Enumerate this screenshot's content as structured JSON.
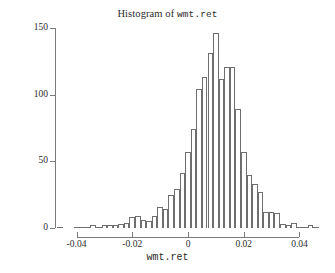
{
  "chart_data": {
    "type": "bar",
    "title": "Histogram of wmt.ret",
    "title_prefix": "Histogram of ",
    "title_variable": "wmt.ret",
    "xlabel": "wmt.ret",
    "ylabel": "Frequency",
    "xlim": [
      -0.047,
      0.047
    ],
    "ylim": [
      0,
      150
    ],
    "grid": false,
    "legend": null,
    "bin_width": 0.002,
    "xticks": [
      -0.04,
      -0.02,
      0,
      0.02,
      0.04
    ],
    "xtick_labels": [
      "-0.04",
      "-0.02",
      "0",
      "0.02",
      "0.04"
    ],
    "yticks": [
      0,
      50,
      100,
      150
    ],
    "ytick_labels": [
      "0",
      "50",
      "100",
      "150"
    ],
    "bin_edges": [
      -0.047,
      -0.045,
      -0.043,
      -0.041,
      -0.039,
      -0.037,
      -0.035,
      -0.033,
      -0.031,
      -0.029,
      -0.027,
      -0.025,
      -0.023,
      -0.021,
      -0.019,
      -0.017,
      -0.015,
      -0.013,
      -0.011,
      -0.009,
      -0.007,
      -0.005,
      -0.003,
      -0.001,
      0.001,
      0.003,
      0.005,
      0.007,
      0.009,
      0.011,
      0.013,
      0.015,
      0.017,
      0.019,
      0.021,
      0.023,
      0.025,
      0.027,
      0.029,
      0.031,
      0.033,
      0.035,
      0.037,
      0.039,
      0.041,
      0.043,
      0.045,
      0.047
    ],
    "bin_centers": [
      -0.046,
      -0.044,
      -0.042,
      -0.04,
      -0.038,
      -0.036,
      -0.034,
      -0.032,
      -0.03,
      -0.028,
      -0.026,
      -0.024,
      -0.022,
      -0.02,
      -0.018,
      -0.016,
      -0.014,
      -0.012,
      -0.01,
      -0.008,
      -0.006,
      -0.004,
      -0.002,
      0.0,
      0.002,
      0.004,
      0.006,
      0.008,
      0.01,
      0.012,
      0.014,
      0.016,
      0.018,
      0.02,
      0.022,
      0.024,
      0.026,
      0.028,
      0.03,
      0.032,
      0.034,
      0.036,
      0.038,
      0.04,
      0.042,
      0.044,
      0.046
    ],
    "categories": [
      "-0.046",
      "-0.044",
      "-0.042",
      "-0.040",
      "-0.038",
      "-0.036",
      "-0.034",
      "-0.032",
      "-0.030",
      "-0.028",
      "-0.026",
      "-0.024",
      "-0.022",
      "-0.020",
      "-0.018",
      "-0.016",
      "-0.014",
      "-0.012",
      "-0.010",
      "-0.008",
      "-0.006",
      "-0.004",
      "-0.002",
      "0.000",
      "0.002",
      "0.004",
      "0.006",
      "0.008",
      "0.010",
      "0.012",
      "0.014",
      "0.016",
      "0.018",
      "0.020",
      "0.022",
      "0.024",
      "0.026",
      "0.028",
      "0.030",
      "0.032",
      "0.034",
      "0.036",
      "0.038",
      "0.040",
      "0.042",
      "0.044",
      "0.046"
    ],
    "values": [
      1,
      0,
      0,
      1,
      1,
      1,
      2,
      1,
      2,
      2,
      2,
      3,
      4,
      8,
      9,
      6,
      5,
      9,
      16,
      14,
      25,
      29,
      41,
      57,
      74,
      104,
      113,
      131,
      146,
      112,
      121,
      121,
      89,
      57,
      40,
      33,
      27,
      12,
      12,
      11,
      3,
      2,
      4,
      1,
      1,
      2,
      1
    ],
    "colors": {
      "bar_fill": "#ffffff",
      "bar_edge": "#6e6e6e",
      "axis": "#7a7a7a",
      "text": "#2b2b2b",
      "background": "#ffffff"
    }
  }
}
